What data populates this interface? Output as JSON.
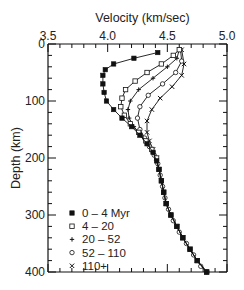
{
  "chart_data": {
    "type": "line",
    "title": "",
    "xlabel": "Velocity (km/sec)",
    "ylabel": "Depth (km)",
    "xlim": [
      3.5,
      5.0
    ],
    "ylim": [
      0,
      400
    ],
    "y_inverted": true,
    "x_axis_position": "top",
    "x_ticks": [
      3.5,
      4.0,
      4.5,
      5.0
    ],
    "x_tick_labels": [
      "3.5",
      "4.0",
      "4.5",
      "5.0"
    ],
    "x_minor_step": 0.1,
    "y_ticks": [
      0,
      100,
      200,
      300,
      400
    ],
    "y_tick_labels": [
      "0",
      "100",
      "200",
      "300",
      "400"
    ],
    "y_minor_step": 20,
    "grid": false,
    "legend_position": "lower-left",
    "series": [
      {
        "name": "0 – 4 Myr",
        "marker": "filled-square",
        "points": [
          [
            4.42,
            15
          ],
          [
            4.22,
            25
          ],
          [
            4.05,
            35
          ],
          [
            3.98,
            45
          ],
          [
            3.96,
            55
          ],
          [
            3.96,
            70
          ],
          [
            3.97,
            85
          ],
          [
            3.99,
            100
          ],
          [
            4.05,
            115
          ],
          [
            4.12,
            130
          ],
          [
            4.2,
            145
          ],
          [
            4.27,
            160
          ],
          [
            4.33,
            175
          ],
          [
            4.38,
            190
          ],
          [
            4.41,
            205
          ],
          [
            4.43,
            220
          ],
          [
            4.45,
            240
          ],
          [
            4.47,
            260
          ],
          [
            4.49,
            280
          ],
          [
            4.53,
            300
          ],
          [
            4.58,
            320
          ],
          [
            4.63,
            340
          ],
          [
            4.69,
            360
          ],
          [
            4.75,
            380
          ],
          [
            4.83,
            400
          ]
        ]
      },
      {
        "name": "4 – 20",
        "marker": "open-square",
        "points": [
          [
            4.6,
            10
          ],
          [
            4.55,
            20
          ],
          [
            4.45,
            35
          ],
          [
            4.33,
            50
          ],
          [
            4.23,
            65
          ],
          [
            4.15,
            80
          ],
          [
            4.12,
            95
          ],
          [
            4.11,
            110
          ],
          [
            4.14,
            125
          ],
          [
            4.19,
            140
          ],
          [
            4.26,
            155
          ],
          [
            4.32,
            170
          ],
          [
            4.37,
            185
          ],
          [
            4.41,
            200
          ],
          [
            4.43,
            220
          ],
          [
            4.45,
            240
          ],
          [
            4.47,
            260
          ],
          [
            4.49,
            280
          ],
          [
            4.53,
            300
          ],
          [
            4.58,
            320
          ],
          [
            4.63,
            340
          ],
          [
            4.69,
            360
          ],
          [
            4.75,
            380
          ],
          [
            4.83,
            400
          ]
        ]
      },
      {
        "name": "20 – 52",
        "marker": "plus",
        "points": [
          [
            4.6,
            10
          ],
          [
            4.58,
            25
          ],
          [
            4.5,
            40
          ],
          [
            4.38,
            60
          ],
          [
            4.26,
            80
          ],
          [
            4.19,
            100
          ],
          [
            4.17,
            115
          ],
          [
            4.18,
            130
          ],
          [
            4.22,
            145
          ],
          [
            4.28,
            160
          ],
          [
            4.33,
            175
          ],
          [
            4.38,
            190
          ],
          [
            4.41,
            205
          ],
          [
            4.43,
            220
          ],
          [
            4.45,
            240
          ],
          [
            4.47,
            260
          ],
          [
            4.49,
            280
          ],
          [
            4.53,
            300
          ],
          [
            4.58,
            320
          ],
          [
            4.63,
            340
          ],
          [
            4.69,
            360
          ],
          [
            4.75,
            380
          ],
          [
            4.83,
            400
          ]
        ]
      },
      {
        "name": "52 – 110",
        "marker": "open-circle",
        "points": [
          [
            4.61,
            10
          ],
          [
            4.62,
            30
          ],
          [
            4.57,
            50
          ],
          [
            4.46,
            70
          ],
          [
            4.34,
            90
          ],
          [
            4.27,
            110
          ],
          [
            4.25,
            130
          ],
          [
            4.27,
            150
          ],
          [
            4.31,
            165
          ],
          [
            4.35,
            180
          ],
          [
            4.39,
            195
          ],
          [
            4.42,
            210
          ],
          [
            4.44,
            230
          ],
          [
            4.46,
            250
          ],
          [
            4.48,
            270
          ],
          [
            4.51,
            290
          ],
          [
            4.55,
            310
          ],
          [
            4.6,
            330
          ],
          [
            4.66,
            350
          ],
          [
            4.72,
            370
          ],
          [
            4.78,
            390
          ],
          [
            4.83,
            400
          ]
        ]
      },
      {
        "name": "110+",
        "marker": "cross",
        "points": [
          [
            4.62,
            10
          ],
          [
            4.64,
            35
          ],
          [
            4.62,
            55
          ],
          [
            4.54,
            75
          ],
          [
            4.44,
            95
          ],
          [
            4.37,
            115
          ],
          [
            4.33,
            135
          ],
          [
            4.33,
            155
          ],
          [
            4.35,
            170
          ],
          [
            4.38,
            185
          ],
          [
            4.41,
            200
          ],
          [
            4.43,
            220
          ],
          [
            4.45,
            240
          ],
          [
            4.47,
            260
          ],
          [
            4.49,
            280
          ],
          [
            4.53,
            300
          ],
          [
            4.58,
            320
          ],
          [
            4.63,
            340
          ],
          [
            4.69,
            360
          ],
          [
            4.75,
            380
          ],
          [
            4.83,
            400
          ]
        ]
      }
    ]
  }
}
